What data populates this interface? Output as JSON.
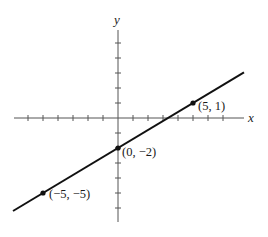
{
  "chart_data": {
    "type": "line",
    "title": "",
    "xlabel": "x",
    "ylabel": "y",
    "xlim": [
      -7,
      8
    ],
    "ylim": [
      -7,
      6
    ],
    "grid": false,
    "x_ticks": [
      -6,
      -5,
      -4,
      -3,
      -2,
      -1,
      1,
      2,
      3,
      4,
      5,
      6,
      7
    ],
    "y_ticks": [
      -6,
      -5,
      -4,
      -3,
      -2,
      -1,
      1,
      2,
      3,
      4,
      5
    ],
    "series": [
      {
        "name": "line",
        "equation": "y = (3/5)x - 2",
        "x": [
          -7,
          8.4
        ],
        "y": [
          -6.2,
          3.04
        ]
      }
    ],
    "points": [
      {
        "x": 5,
        "y": 1,
        "label": "(5, 1)"
      },
      {
        "x": 0,
        "y": -2,
        "label": "(0, −2)"
      },
      {
        "x": -5,
        "y": -5,
        "label": "(−5, −5)"
      }
    ]
  },
  "labels": {
    "x_axis": "x",
    "y_axis": "y",
    "p1": "(5, 1)",
    "p2": "(0, −2)",
    "p3": "(−5, −5)"
  },
  "colors": {
    "axis": "#555555",
    "line": "#111111",
    "text": "#1a1a1a"
  }
}
